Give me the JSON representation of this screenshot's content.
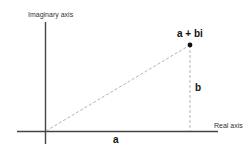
{
  "diagram": {
    "type": "complex-plane",
    "axes": {
      "vertical_label": "Imaginary axis",
      "horizontal_label": "Real axis"
    },
    "point_label": "a + bi",
    "horizontal_component_label": "a",
    "vertical_component_label": "b",
    "colors": {
      "axis": "#444444",
      "dashed": "#aaaaaa",
      "point": "#111111"
    }
  }
}
